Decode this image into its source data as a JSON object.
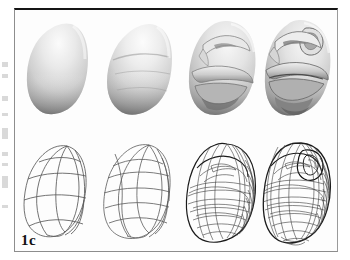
{
  "figure": {
    "label": "1c",
    "border_color": "#151515",
    "background_color": "#fdfdfd",
    "page_background": "#ffffff",
    "rows": [
      {
        "name": "shaded-renders",
        "render_mode": "shaded",
        "cells": [
          {
            "name": "subdivision-level-0-shaded",
            "caption": "",
            "description": "smooth untextured teardrop blob, base control cage evaluated"
          },
          {
            "name": "subdivision-level-1-shaded",
            "caption": "",
            "description": "blob with faint brow and muzzle creases emerging"
          },
          {
            "name": "subdivision-level-2-shaded",
            "caption": "",
            "description": "gorilla head with defined brow ridge, eye socket, nose and lower jaw"
          },
          {
            "name": "subdivision-level-3-shaded",
            "caption": "",
            "description": "fully refined gorilla head with ear, deep brow, lips and chin"
          }
        ]
      },
      {
        "name": "control-meshes",
        "render_mode": "wireframe",
        "cells": [
          {
            "name": "subdivision-level-0-wireframe",
            "caption": "",
            "description": "coarse control cage, few quads"
          },
          {
            "name": "subdivision-level-1-wireframe",
            "caption": "",
            "description": "once subdivided quad mesh"
          },
          {
            "name": "subdivision-level-2-wireframe",
            "caption": "",
            "description": "dense quad mesh following facial features"
          },
          {
            "name": "subdivision-level-3-wireframe",
            "caption": "",
            "description": "very dense quad mesh with ear and jaw detail"
          }
        ]
      }
    ]
  },
  "margin_marks": [
    {
      "top": 62,
      "height": 5
    },
    {
      "top": 74,
      "height": 4
    },
    {
      "top": 96,
      "height": 5
    },
    {
      "top": 113,
      "height": 3
    },
    {
      "top": 128,
      "height": 11
    },
    {
      "top": 152,
      "height": 4
    },
    {
      "top": 163,
      "height": 3
    },
    {
      "top": 176,
      "height": 12
    },
    {
      "top": 205,
      "height": 3
    }
  ]
}
